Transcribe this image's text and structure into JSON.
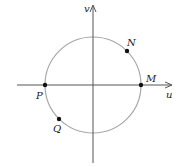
{
  "diagram": {
    "type": "unit-circle-plane",
    "axes": {
      "horizontal": {
        "label": "u"
      },
      "vertical": {
        "label": "v"
      }
    },
    "circle": {
      "stroke": "#a8a8a8"
    },
    "points": [
      {
        "id": "N",
        "label": "N",
        "position": "upper-right on circle"
      },
      {
        "id": "M",
        "label": "M",
        "position": "positive u-axis intersection"
      },
      {
        "id": "P",
        "label": "P",
        "position": "negative u-axis intersection"
      },
      {
        "id": "Q",
        "label": "Q",
        "position": "lower-left on circle"
      }
    ],
    "colors": {
      "axis": "#555555",
      "point": "#111111",
      "circle": "#a8a8a8"
    }
  }
}
